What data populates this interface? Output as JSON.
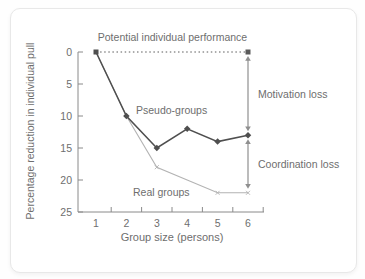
{
  "figure": {
    "y_axis_title": "Percentage reduction in individual pull",
    "x_axis_title": "Group size (persons)",
    "labels": {
      "potential": "Potential individual performance",
      "pseudo_groups": "Pseudo-groups",
      "real_groups": "Real groups",
      "motivation_loss": "Motivation loss",
      "coordination_loss": "Coordination loss"
    }
  },
  "colors": {
    "pseudo_line": "#4f4f4f",
    "real_line": "#b3b3b3",
    "dotted_line": "#5a5a5a",
    "arrow": "#8f8f8f",
    "axis": "#8a8a8a",
    "text": "#6e6e6e",
    "card_border": "#e8e8e8",
    "card_bg": "#ffffff"
  },
  "chart_data": {
    "type": "line",
    "title": "",
    "xlabel": "Group size (persons)",
    "ylabel": "Percentage reduction in individual pull",
    "x": [
      1,
      2,
      3,
      4,
      5,
      6
    ],
    "x_ticks": [
      "1",
      "2",
      "3",
      "4",
      "5",
      "6"
    ],
    "x_minor_ticks": [
      1.5,
      2.5,
      3.5,
      4.5,
      5.5,
      6.5
    ],
    "y_ticks": [
      "0",
      "5",
      "10",
      "15",
      "20",
      "25"
    ],
    "y_tick_values": [
      0,
      5,
      10,
      15,
      20,
      25
    ],
    "ylim": [
      0,
      25
    ],
    "y_inverted": true,
    "grid": false,
    "legend_position": "inline-labels",
    "series": [
      {
        "name": "Pseudo-groups",
        "values": [
          0,
          10,
          15,
          12,
          14,
          13
        ],
        "marker": "diamond",
        "style": "solid"
      },
      {
        "name": "Real groups",
        "values": [
          0,
          10,
          18,
          20,
          22,
          22
        ],
        "marker": "x",
        "marker_x": [
          3,
          5,
          6
        ],
        "style": "solid"
      },
      {
        "name": "Potential individual performance",
        "values": [
          0,
          0,
          0,
          0,
          0,
          0
        ],
        "marker": "square-at-end",
        "style": "dotted"
      }
    ],
    "annotations": [
      {
        "label": "Motivation loss",
        "at_x": 6,
        "from": 0,
        "to": 13,
        "arrow": "double"
      },
      {
        "label": "Coordination loss",
        "at_x": 6,
        "from": 13,
        "to": 22,
        "arrow": "double"
      }
    ]
  }
}
